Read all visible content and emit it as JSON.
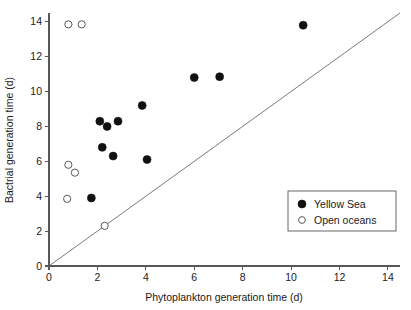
{
  "chart_data": {
    "type": "scatter",
    "title": "",
    "xlabel": "Phytoplankton generation time (d)",
    "ylabel": "Bactrial generation time (d)",
    "xlim": [
      0,
      14.5
    ],
    "ylim": [
      0,
      14.5
    ],
    "xticks": [
      "0",
      "2",
      "4",
      "6",
      "8",
      "10",
      "12",
      "14"
    ],
    "xtick_values": [
      0,
      2,
      4,
      6,
      8,
      10,
      12,
      14
    ],
    "yticks": [
      "0",
      "2",
      "4",
      "6",
      "8",
      "10",
      "12",
      "14"
    ],
    "ytick_values": [
      0,
      2,
      4,
      6,
      8,
      10,
      12,
      14
    ],
    "grid": false,
    "legend_position": "lower-right",
    "reference_line": {
      "name": "1:1 identity line",
      "from": [
        0,
        0
      ],
      "to": [
        14.5,
        14.5
      ]
    },
    "series": [
      {
        "name": "Yellow Sea",
        "marker": "filled-circle",
        "color": "#111111",
        "points": [
          [
            1.75,
            3.9
          ],
          [
            2.2,
            6.8
          ],
          [
            2.65,
            6.3
          ],
          [
            2.1,
            8.3
          ],
          [
            2.4,
            8.0
          ],
          [
            2.85,
            8.3
          ],
          [
            3.85,
            9.2
          ],
          [
            4.05,
            6.1
          ],
          [
            6.0,
            10.8
          ],
          [
            7.05,
            10.85
          ],
          [
            10.5,
            13.8
          ]
        ]
      },
      {
        "name": "Open oceans",
        "marker": "open-circle",
        "color": "#58585a",
        "points": [
          [
            0.8,
            13.85
          ],
          [
            1.35,
            13.85
          ],
          [
            0.8,
            5.8
          ],
          [
            1.07,
            5.35
          ],
          [
            0.75,
            3.85
          ],
          [
            2.3,
            2.3
          ]
        ]
      }
    ]
  },
  "legend": {
    "entries": [
      {
        "label": "Yellow Sea",
        "marker": "filled-circle"
      },
      {
        "label": "Open oceans",
        "marker": "open-circle"
      }
    ]
  }
}
